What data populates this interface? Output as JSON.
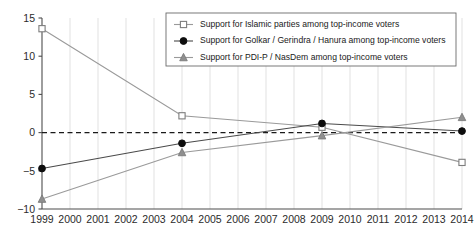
{
  "chart_data": {
    "type": "line",
    "title": "",
    "subtitle": "",
    "xlabel": "",
    "ylabel": "",
    "x": [
      1999,
      2004,
      2009,
      2014
    ],
    "xticklabels": [
      "1999",
      "2000",
      "2001",
      "2002",
      "2003",
      "2004",
      "2005",
      "2006",
      "2007",
      "2008",
      "2009",
      "2010",
      "2011",
      "2012",
      "2013",
      "2014"
    ],
    "yticklabels": [
      "15",
      "10",
      "5",
      "0",
      "-5",
      "-10"
    ],
    "yticks": [
      15,
      10,
      5,
      0,
      -5,
      -10
    ],
    "xlim": [
      1999,
      2014
    ],
    "ylim": [
      -10,
      15
    ],
    "grid": "vertical-yearly",
    "legend_position": "top-right-inside",
    "zero_reference_line": 0,
    "series": [
      {
        "name": "Support for Islamic parties among top-income voters",
        "marker": "open-square",
        "color": "#9a9a9a",
        "x": [
          1999,
          2004,
          2009,
          2014
        ],
        "values": [
          13.6,
          2.2,
          0.7,
          -3.9
        ]
      },
      {
        "name": "Support for Golkar / Gerindra / Hanura among top-income voters",
        "marker": "filled-circle",
        "color": "#0d0d0d",
        "x": [
          1999,
          2004,
          2009,
          2014
        ],
        "values": [
          -4.7,
          -1.4,
          1.2,
          0.2
        ]
      },
      {
        "name": "Support for PDI-P / NasDem among top-income voters",
        "marker": "filled-triangle",
        "color": "#8f8f8f",
        "x": [
          1999,
          2004,
          2009,
          2014
        ],
        "values": [
          -8.7,
          -2.6,
          -0.4,
          2.0
        ]
      }
    ]
  },
  "legend": {
    "items": [
      {
        "label": "Support for Islamic parties among top-income voters",
        "marker": "open-square"
      },
      {
        "label": "Support for Golkar / Gerindra / Hanura among top-income voters",
        "marker": "filled-circle"
      },
      {
        "label": "Support for PDI-P / NasDem among top-income voters",
        "marker": "filled-triangle"
      }
    ]
  },
  "axes": {
    "y_labels": [
      "15",
      "10",
      "5",
      "0",
      "-5",
      "-10"
    ],
    "x_labels": [
      "1999",
      "2000",
      "2001",
      "2002",
      "2003",
      "2004",
      "2005",
      "2006",
      "2007",
      "2008",
      "2009",
      "2010",
      "2011",
      "2012",
      "2013",
      "2014"
    ]
  },
  "colors": {
    "islamic": "#9a9a9a",
    "golkar": "#0d0d0d",
    "pdip": "#8f8f8f",
    "axis": "#4d4d4d",
    "grid": "#d9d9d9",
    "zero": "#1a1a1a",
    "background": "#ffffff"
  }
}
